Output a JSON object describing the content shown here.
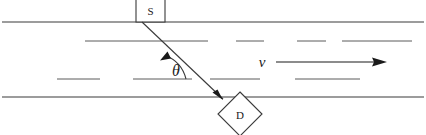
{
  "diagram": {
    "background_color": "#ffffff",
    "line_color": "#3a3a3a",
    "dash_color": "#5a5a5a",
    "text_color": "#1a1a1a",
    "labels": {
      "source": "S",
      "detector": "D",
      "angle": "θ",
      "velocity": "ν"
    },
    "geometry": {
      "pipe_top_y": 22,
      "pipe_bottom_y": 97,
      "pipe_left_x": 2,
      "pipe_right_x": 424,
      "source_box": {
        "x": 136,
        "y": 0,
        "width": 29,
        "height": 22
      },
      "detector_diamond": {
        "cx": 240,
        "cy": 114,
        "half": 22
      },
      "beam": {
        "x1": 142,
        "y1": 22,
        "x2": 224,
        "y2": 100
      },
      "beam_arrow_tip": {
        "x": 222,
        "y": 98
      },
      "angle_arc_radius": 34,
      "angle_vertex": {
        "x": 152,
        "y": 80
      },
      "velocity_arrow": {
        "x1": 279,
        "y1": 62,
        "x2": 386,
        "y2": 62
      },
      "velocity_label_pos": {
        "x": 262,
        "y": 68
      },
      "angle_label_pos": {
        "x": 170,
        "y": 76
      },
      "flow_line_upper_y": 41,
      "flow_line_lower_y": 79
    },
    "flow_lines": {
      "upper": [
        {
          "x1": 85,
          "x2": 208
        },
        {
          "x1": 236,
          "x2": 264
        },
        {
          "x1": 297,
          "x2": 326
        },
        {
          "x1": 342,
          "x2": 412
        }
      ],
      "lower": [
        {
          "x1": 57,
          "x2": 100
        },
        {
          "x1": 133,
          "x2": 192
        },
        {
          "x1": 210,
          "x2": 260
        },
        {
          "x1": 295,
          "x2": 360
        }
      ]
    }
  }
}
